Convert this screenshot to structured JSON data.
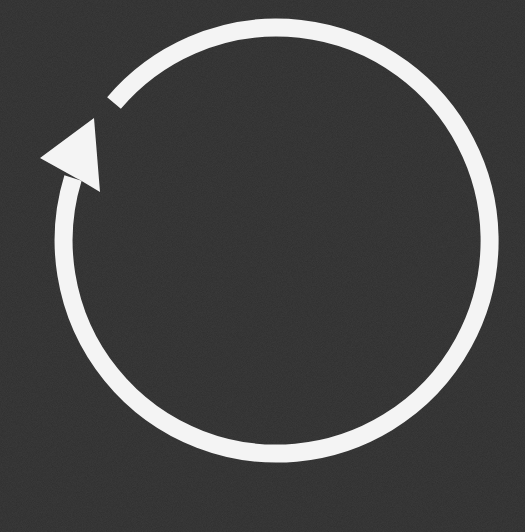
{
  "image": {
    "subject": "circular refresh / cycle arrow",
    "icon": "refresh-icon",
    "direction": "counterclockwise",
    "colors": {
      "background": "#2e2e2e",
      "foreground": "#f4f4f4"
    }
  }
}
